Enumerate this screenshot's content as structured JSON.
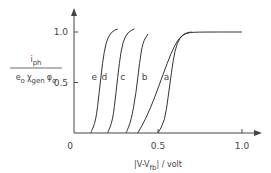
{
  "chart_data": {
    "type": "line",
    "title": "",
    "xlabel": "|V-V_fb| / volt",
    "xlabel_main": "|V-V",
    "xlabel_sub": "fb",
    "xlabel_tail": "| / volt",
    "ylabel_num": "i",
    "ylabel_num_sub": "ph",
    "ylabel_den": "e",
    "ylabel_den_parts": [
      "e",
      "o",
      "χ",
      "gen",
      "φ",
      "o"
    ],
    "xlim": [
      0,
      1.15
    ],
    "ylim": [
      0,
      1.2
    ],
    "x_ticks": [
      {
        "value": 0,
        "label": "0"
      },
      {
        "value": 0.5,
        "label": "0.5"
      },
      {
        "value": 1.0,
        "label": "1.0"
      }
    ],
    "y_ticks": [
      {
        "value": 0.5,
        "label": "0.5"
      },
      {
        "value": 1.0,
        "label": "1.0"
      }
    ],
    "grid": false,
    "series": [
      {
        "name": "e",
        "label_at": [
          0.12,
          0.55
        ],
        "points": [
          [
            0.1,
            0
          ],
          [
            0.13,
            0.12
          ],
          [
            0.15,
            0.4
          ],
          [
            0.17,
            0.7
          ],
          [
            0.19,
            0.9
          ],
          [
            0.22,
            1.0
          ],
          [
            0.26,
            1.03
          ]
        ]
      },
      {
        "name": "d",
        "label_at": [
          0.18,
          0.55
        ],
        "points": [
          [
            0.2,
            0
          ],
          [
            0.23,
            0.12
          ],
          [
            0.25,
            0.4
          ],
          [
            0.27,
            0.7
          ],
          [
            0.29,
            0.9
          ],
          [
            0.32,
            1.0
          ],
          [
            0.36,
            1.03
          ]
        ]
      },
      {
        "name": "c",
        "label_at": [
          0.29,
          0.55
        ],
        "points": [
          [
            0.31,
            0
          ],
          [
            0.34,
            0.12
          ],
          [
            0.37,
            0.4
          ],
          [
            0.39,
            0.7
          ],
          [
            0.41,
            0.9
          ],
          [
            0.44,
            0.98
          ]
        ]
      },
      {
        "name": "b",
        "label_at": [
          0.42,
          0.55
        ],
        "points": [
          [
            0.38,
            0
          ],
          [
            0.43,
            0.15
          ],
          [
            0.48,
            0.35
          ],
          [
            0.53,
            0.58
          ],
          [
            0.58,
            0.8
          ],
          [
            0.62,
            0.93
          ],
          [
            0.66,
            0.99
          ],
          [
            0.7,
            1.0
          ]
        ]
      },
      {
        "name": "a",
        "label_at": [
          0.55,
          0.55
        ],
        "points": [
          [
            0.5,
            0
          ],
          [
            0.54,
            0.12
          ],
          [
            0.56,
            0.35
          ],
          [
            0.58,
            0.6
          ],
          [
            0.6,
            0.82
          ],
          [
            0.63,
            0.95
          ],
          [
            0.67,
            0.99
          ],
          [
            0.72,
            1.0
          ],
          [
            1.0,
            1.0
          ]
        ]
      }
    ]
  }
}
